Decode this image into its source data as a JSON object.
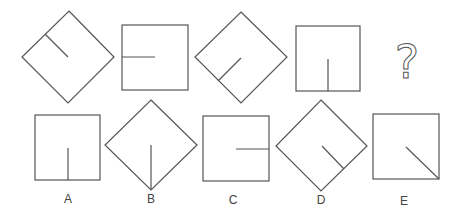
{
  "puzzle": {
    "question_mark": "?",
    "sequence": [
      {
        "id": "seq-1",
        "shape": "diamond",
        "line": "upper-left-edge-to-center"
      },
      {
        "id": "seq-2",
        "shape": "square",
        "line": "left-edge-to-center"
      },
      {
        "id": "seq-3",
        "shape": "diamond",
        "line": "lower-left-edge-to-center"
      },
      {
        "id": "seq-4",
        "shape": "square",
        "line": "bottom-edge-to-center"
      }
    ],
    "options": [
      {
        "label": "A",
        "shape": "square",
        "line": "bottom-edge-to-center"
      },
      {
        "label": "B",
        "shape": "diamond",
        "line": "bottom-vertex-to-center"
      },
      {
        "label": "C",
        "shape": "square",
        "line": "right-edge-to-center"
      },
      {
        "label": "D",
        "shape": "diamond",
        "line": "lower-right-edge-to-center"
      },
      {
        "label": "E",
        "shape": "square",
        "line": "bottom-right-corner-to-center"
      }
    ]
  },
  "colors": {
    "stroke": "#555555",
    "background": "#ffffff"
  }
}
